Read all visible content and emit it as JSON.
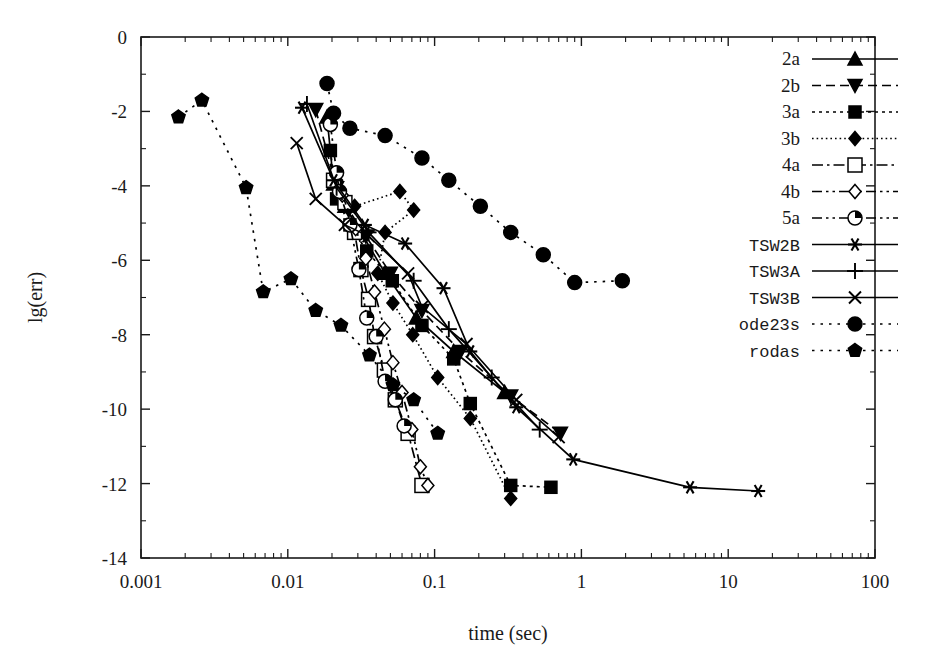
{
  "chart_data": {
    "type": "line",
    "title": "",
    "xlabel": "time (sec)",
    "ylabel": "lg(err)",
    "xscale": "log",
    "yscale": "linear",
    "xlim": [
      0.001,
      100
    ],
    "ylim": [
      -14,
      0
    ],
    "grid": false,
    "legend_position": "top-right",
    "x_ticks": [
      "0.001",
      "0.01",
      "0.1",
      "1",
      "10",
      "100"
    ],
    "x_tick_values": [
      0.001,
      0.01,
      0.1,
      1,
      10,
      100
    ],
    "y_ticks": [
      "0",
      "-2",
      "-4",
      "-6",
      "-8",
      "-10",
      "-12",
      "-14"
    ],
    "y_tick_values": [
      0,
      -2,
      -4,
      -6,
      -8,
      -10,
      -12,
      -14
    ],
    "y_minor_tick_values": [
      -1,
      -3,
      -5,
      -7,
      -9,
      -11,
      -13
    ],
    "series": [
      {
        "name": "2a",
        "marker": "triangle-up",
        "fill": "filled",
        "dash": "solid",
        "points": [
          [
            0.0185,
            -2.15
          ],
          [
            0.0205,
            -3.95
          ],
          [
            0.0245,
            -4.55
          ],
          [
            0.0315,
            -5.25
          ],
          [
            0.046,
            -6.35
          ],
          [
            0.075,
            -7.55
          ],
          [
            0.135,
            -8.45
          ],
          [
            0.3,
            -9.55
          ]
        ]
      },
      {
        "name": "2b",
        "marker": "triangle-down",
        "fill": "filled",
        "dash": "dashed",
        "points": [
          [
            0.0155,
            -1.95
          ],
          [
            0.0215,
            -4.05
          ],
          [
            0.026,
            -4.65
          ],
          [
            0.034,
            -5.35
          ],
          [
            0.05,
            -6.35
          ],
          [
            0.082,
            -7.35
          ],
          [
            0.15,
            -8.45
          ],
          [
            0.33,
            -9.65
          ],
          [
            0.72,
            -10.65
          ]
        ]
      },
      {
        "name": "3a",
        "marker": "square",
        "fill": "filled",
        "dash": "dotted",
        "points": [
          [
            0.0195,
            -3.05
          ],
          [
            0.0215,
            -4.35
          ],
          [
            0.0265,
            -5.05
          ],
          [
            0.0345,
            -5.75
          ],
          [
            0.0515,
            -6.55
          ],
          [
            0.082,
            -7.75
          ],
          [
            0.135,
            -8.65
          ],
          [
            0.175,
            -9.85
          ],
          [
            0.33,
            -12.05
          ],
          [
            0.62,
            -12.1
          ]
        ]
      },
      {
        "name": "3b",
        "marker": "diamond",
        "fill": "filled",
        "dash": "fine-dotted",
        "points": [
          [
            0.0215,
            -3.85
          ],
          [
            0.0285,
            -4.55
          ],
          [
            0.058,
            -4.15
          ],
          [
            0.072,
            -4.65
          ],
          [
            0.046,
            -5.25
          ],
          [
            0.041,
            -6.35
          ],
          [
            0.052,
            -7.15
          ],
          [
            0.071,
            -8.0
          ],
          [
            0.105,
            -9.15
          ],
          [
            0.175,
            -10.25
          ],
          [
            0.33,
            -12.4
          ]
        ]
      },
      {
        "name": "4a",
        "marker": "square-open",
        "fill": "open",
        "dash": "dashdot",
        "points": [
          [
            0.0205,
            -3.85
          ],
          [
            0.0245,
            -4.45
          ],
          [
            0.0285,
            -5.25
          ],
          [
            0.0315,
            -6.25
          ],
          [
            0.0355,
            -7.05
          ],
          [
            0.039,
            -8.05
          ],
          [
            0.0455,
            -8.95
          ],
          [
            0.054,
            -9.75
          ],
          [
            0.066,
            -10.65
          ],
          [
            0.082,
            -12.05
          ]
        ]
      },
      {
        "name": "4b",
        "marker": "diamond-open",
        "fill": "open",
        "dash": "dashdotdot",
        "points": [
          [
            0.0235,
            -4.25
          ],
          [
            0.029,
            -5.15
          ],
          [
            0.034,
            -5.95
          ],
          [
            0.039,
            -6.85
          ],
          [
            0.0455,
            -7.85
          ],
          [
            0.052,
            -8.75
          ],
          [
            0.06,
            -9.55
          ],
          [
            0.07,
            -10.55
          ],
          [
            0.08,
            -11.55
          ],
          [
            0.09,
            -12.05
          ]
        ]
      },
      {
        "name": "5a",
        "marker": "circle-pie",
        "fill": "open",
        "dash": "dashdotdot",
        "points": [
          [
            0.0195,
            -2.35
          ],
          [
            0.0215,
            -3.65
          ],
          [
            0.0225,
            -4.15
          ],
          [
            0.0265,
            -5.05
          ],
          [
            0.0305,
            -6.25
          ],
          [
            0.0345,
            -7.55
          ],
          [
            0.04,
            -8.05
          ],
          [
            0.046,
            -9.25
          ],
          [
            0.054,
            -9.75
          ],
          [
            0.062,
            -10.45
          ]
        ]
      },
      {
        "name": "TSW2B",
        "marker": "asterisk",
        "fill": "filled",
        "dash": "solid",
        "points": [
          [
            0.0125,
            -1.9
          ],
          [
            0.0205,
            -3.85
          ],
          [
            0.0335,
            -5.05
          ],
          [
            0.063,
            -5.55
          ],
          [
            0.115,
            -6.75
          ],
          [
            0.175,
            -8.45
          ],
          [
            0.36,
            -9.95
          ],
          [
            0.88,
            -11.35
          ],
          [
            5.5,
            -12.1
          ],
          [
            16.0,
            -12.2
          ]
        ]
      },
      {
        "name": "TSW3A",
        "marker": "plus",
        "fill": "filled",
        "dash": "solid",
        "points": [
          [
            0.0135,
            -1.8
          ],
          [
            0.0215,
            -4.05
          ],
          [
            0.0355,
            -5.25
          ],
          [
            0.072,
            -6.55
          ],
          [
            0.125,
            -7.85
          ],
          [
            0.245,
            -9.15
          ],
          [
            0.52,
            -10.55
          ]
        ]
      },
      {
        "name": "TSW3B",
        "marker": "cross",
        "fill": "filled",
        "dash": "solid",
        "points": [
          [
            0.0115,
            -2.85
          ],
          [
            0.0155,
            -4.35
          ],
          [
            0.0245,
            -5.05
          ],
          [
            0.0355,
            -5.35
          ],
          [
            0.066,
            -6.35
          ],
          [
            0.082,
            -7.25
          ],
          [
            0.165,
            -8.25
          ],
          [
            0.36,
            -9.75
          ],
          [
            0.7,
            -10.75
          ]
        ]
      },
      {
        "name": "ode23s",
        "marker": "circle",
        "fill": "filled",
        "dash": "loose-dotted",
        "points": [
          [
            0.0185,
            -1.25
          ],
          [
            0.0205,
            -2.05
          ],
          [
            0.0265,
            -2.45
          ],
          [
            0.046,
            -2.65
          ],
          [
            0.082,
            -3.25
          ],
          [
            0.125,
            -3.85
          ],
          [
            0.205,
            -4.55
          ],
          [
            0.33,
            -5.25
          ],
          [
            0.55,
            -5.85
          ],
          [
            0.9,
            -6.6
          ],
          [
            1.9,
            -6.55
          ]
        ]
      },
      {
        "name": "rodas",
        "marker": "pentagon",
        "fill": "filled",
        "dash": "loose-dotted",
        "points": [
          [
            0.0018,
            -2.15
          ],
          [
            0.0026,
            -1.7
          ],
          [
            0.0052,
            -4.05
          ],
          [
            0.0068,
            -6.85
          ],
          [
            0.0105,
            -6.5
          ],
          [
            0.0155,
            -7.35
          ],
          [
            0.023,
            -7.75
          ],
          [
            0.036,
            -8.55
          ],
          [
            0.052,
            -9.35
          ],
          [
            0.072,
            -9.75
          ],
          [
            0.105,
            -10.65
          ]
        ]
      }
    ]
  },
  "legend": {
    "entries": [
      {
        "label": "2a",
        "font": "serif"
      },
      {
        "label": "2b",
        "font": "serif"
      },
      {
        "label": "3a",
        "font": "serif"
      },
      {
        "label": "3b",
        "font": "serif"
      },
      {
        "label": "4a",
        "font": "serif"
      },
      {
        "label": "4b",
        "font": "serif"
      },
      {
        "label": "5a",
        "font": "serif"
      },
      {
        "label": "TSW2B",
        "font": "mono"
      },
      {
        "label": "TSW3A",
        "font": "mono"
      },
      {
        "label": "TSW3B",
        "font": "mono"
      },
      {
        "label": "ode23s",
        "font": "mono"
      },
      {
        "label": "rodas",
        "font": "mono"
      }
    ]
  },
  "colors": {
    "ink": "#1a1a1a",
    "series": "#000000",
    "background": "#ffffff"
  }
}
